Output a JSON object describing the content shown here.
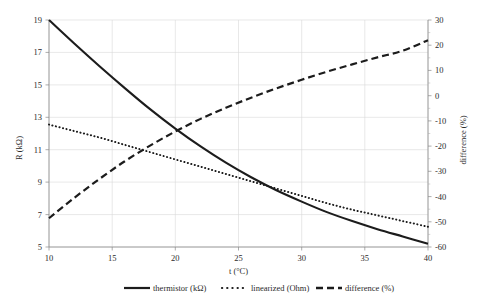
{
  "chart_data": {
    "type": "line",
    "title": "",
    "subtitle": "",
    "xlabel": "t (°C)",
    "ylabel": "R (kΩ)",
    "y2label": "difference (%)",
    "xlim": [
      10,
      40
    ],
    "ylim": [
      5,
      19
    ],
    "y2lim": [
      -60,
      30
    ],
    "xticks": [
      10,
      15,
      20,
      25,
      30,
      35,
      40
    ],
    "yticks": [
      5,
      7,
      9,
      11,
      13,
      15,
      17,
      19
    ],
    "y2ticks": [
      -60,
      -50,
      -40,
      -30,
      -20,
      -10,
      0,
      10,
      20,
      30
    ],
    "xtick_labels": [
      "10",
      "15",
      "20",
      "25",
      "30",
      "35",
      "40"
    ],
    "ytick_labels": [
      "5",
      "7",
      "9",
      "11",
      "13",
      "15",
      "17",
      "19"
    ],
    "y2tick_labels": [
      "-60",
      "-50",
      "-40",
      "-30",
      "-20",
      "-10",
      "0",
      "10",
      "20",
      "30"
    ],
    "grid": true,
    "legend_position": "bottom",
    "x": [
      10,
      12,
      14,
      16,
      18,
      20,
      22,
      24,
      26,
      28,
      30,
      32,
      34,
      36,
      38,
      40
    ],
    "series": [
      {
        "name": "thermistor (kΩ)",
        "axis": "left",
        "style": "solid",
        "color": "#1c1c1c",
        "values": [
          19.0,
          17.55,
          16.15,
          14.8,
          13.5,
          12.3,
          11.2,
          10.2,
          9.3,
          8.5,
          7.8,
          7.15,
          6.6,
          6.1,
          5.65,
          5.2
        ]
      },
      {
        "name": "linearized (Ohm)",
        "axis": "left",
        "style": "dotted",
        "color": "#1c1c1c",
        "values": [
          12.55,
          12.15,
          11.75,
          11.3,
          10.85,
          10.4,
          9.95,
          9.5,
          9.05,
          8.6,
          8.15,
          7.7,
          7.3,
          6.95,
          6.6,
          6.25
        ]
      },
      {
        "name": "difference (%)",
        "axis": "right",
        "style": "dashed",
        "color": "#1c1c1c",
        "values": [
          -48.6,
          -40.5,
          -33.0,
          -26.0,
          -19.8,
          -14.2,
          -9.2,
          -4.8,
          -0.8,
          2.9,
          6.3,
          9.5,
          12.4,
          15.2,
          17.8,
          22.0
        ]
      }
    ],
    "legend": [
      {
        "label": "thermistor (kΩ)",
        "style": "solid"
      },
      {
        "label": "linearized (Ohm)",
        "style": "dotted"
      },
      {
        "label": "difference (%)",
        "style": "dashed"
      }
    ],
    "annotations": []
  }
}
